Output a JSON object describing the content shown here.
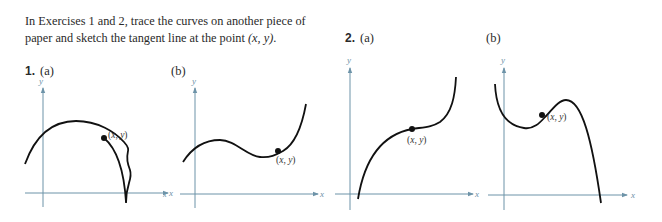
{
  "intro": {
    "text_before": "In Exercises 1 and 2, trace the curves on another piece of paper and sketch the tangent line at the point ",
    "point": "(x, y)",
    "text_after": "."
  },
  "exercises": [
    {
      "number": "1.",
      "parts": [
        {
          "label": "(a)",
          "point_label": "(x, y)",
          "x_axis": "x",
          "y_axis": "y",
          "description": "downward-opening parabola-like curve, point on descending side"
        },
        {
          "label": "(b)",
          "point_label": "(x, y)",
          "x_axis": "x",
          "y_axis": "y",
          "description": "cubic-like curve with local max then min, point after local min"
        }
      ]
    },
    {
      "number": "2.",
      "parts": [
        {
          "label": "(a)",
          "point_label": "(x, y)",
          "x_axis": "x",
          "y_axis": "y",
          "description": "increasing cubic with inflection, point at flat inflection"
        },
        {
          "label": "(b)",
          "point_label": "(x, y)",
          "x_axis": "x",
          "y_axis": "y",
          "description": "curve with local min then max then steep drop, point between"
        }
      ]
    }
  ],
  "colors": {
    "axis": "#6d93a8",
    "curve": "#111111",
    "text": "#2a2a2a"
  }
}
